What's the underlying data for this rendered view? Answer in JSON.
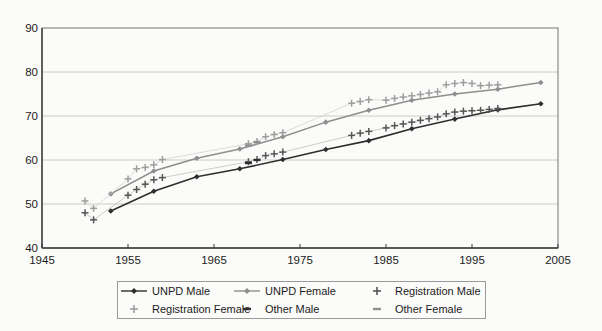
{
  "page": {
    "background": "#fbfbf9"
  },
  "chart_data": {
    "type": "line",
    "title": "",
    "xlabel": "",
    "ylabel": "",
    "xlim": [
      1945,
      2005
    ],
    "ylim": [
      40,
      90
    ],
    "xticks": [
      1945,
      1955,
      1965,
      1975,
      1985,
      1995,
      2005
    ],
    "yticks": [
      40,
      50,
      60,
      70,
      80,
      90
    ],
    "grid": "horizontal",
    "grid_color": "#cccccc",
    "axis_color": "#3a3a3a",
    "frame_color": "#757575",
    "tick_label_color": "#1b1b1b",
    "legend_position": "bottom-center",
    "series": [
      {
        "name": "UNPD Male",
        "marker": "diamond",
        "color": "#2e2e2e",
        "line_color": "#2e2e2e",
        "line_width": 1.6,
        "points": [
          [
            1953,
            48.4
          ],
          [
            1958,
            52.9
          ],
          [
            1963,
            56.2
          ],
          [
            1968,
            58.0
          ],
          [
            1973,
            60.1
          ],
          [
            1978,
            62.4
          ],
          [
            1983,
            64.4
          ],
          [
            1988,
            67.1
          ],
          [
            1993,
            69.3
          ],
          [
            1998,
            71.4
          ],
          [
            2003,
            72.8
          ]
        ]
      },
      {
        "name": "UNPD Female",
        "marker": "diamond",
        "color": "#8e8e8e",
        "line_color": "#8e8e8e",
        "line_width": 1.5,
        "points": [
          [
            1953,
            52.3
          ],
          [
            1958,
            57.5
          ],
          [
            1963,
            60.4
          ],
          [
            1968,
            62.5
          ],
          [
            1973,
            65.3
          ],
          [
            1978,
            68.6
          ],
          [
            1983,
            71.3
          ],
          [
            1988,
            73.6
          ],
          [
            1993,
            75.0
          ],
          [
            1998,
            76.1
          ],
          [
            2003,
            77.6
          ]
        ]
      },
      {
        "name": "Registration Male",
        "marker": "plus",
        "color": "#565656",
        "line_color": "#bdbdbd",
        "line_width": 0.75,
        "points": [
          [
            1950,
            48.0
          ],
          [
            1951,
            46.4
          ],
          [
            1955,
            52.0
          ],
          [
            1956,
            53.3
          ],
          [
            1957,
            54.5
          ],
          [
            1958,
            55.5
          ],
          [
            1959,
            56.0
          ],
          [
            1969,
            59.6
          ],
          [
            1970,
            60.1
          ],
          [
            1971,
            61.0
          ],
          [
            1972,
            61.4
          ],
          [
            1973,
            61.8
          ],
          [
            1981,
            65.6
          ],
          [
            1982,
            66.1
          ],
          [
            1983,
            66.5
          ],
          [
            1985,
            67.3
          ],
          [
            1986,
            67.8
          ],
          [
            1987,
            68.2
          ],
          [
            1988,
            68.6
          ],
          [
            1989,
            69.0
          ],
          [
            1990,
            69.4
          ],
          [
            1991,
            69.8
          ],
          [
            1992,
            70.5
          ],
          [
            1993,
            70.9
          ],
          [
            1994,
            71.1
          ],
          [
            1995,
            71.2
          ],
          [
            1996,
            71.3
          ],
          [
            1997,
            71.5
          ],
          [
            1998,
            71.7
          ]
        ]
      },
      {
        "name": "Registration Female",
        "marker": "plus",
        "color": "#9e9e9e",
        "line_color": "#d0d0d0",
        "line_width": 0.75,
        "points": [
          [
            1950,
            50.7
          ],
          [
            1951,
            49.0
          ],
          [
            1955,
            55.7
          ],
          [
            1956,
            58.0
          ],
          [
            1957,
            58.3
          ],
          [
            1958,
            58.9
          ],
          [
            1959,
            60.1
          ],
          [
            1969,
            63.7
          ],
          [
            1970,
            64.2
          ],
          [
            1971,
            65.3
          ],
          [
            1972,
            65.8
          ],
          [
            1973,
            66.2
          ],
          [
            1981,
            72.9
          ],
          [
            1982,
            73.3
          ],
          [
            1983,
            73.7
          ],
          [
            1985,
            73.6
          ],
          [
            1986,
            74.0
          ],
          [
            1987,
            74.3
          ],
          [
            1988,
            74.6
          ],
          [
            1989,
            74.9
          ],
          [
            1990,
            75.2
          ],
          [
            1991,
            75.5
          ],
          [
            1992,
            77.1
          ],
          [
            1993,
            77.4
          ],
          [
            1994,
            77.6
          ],
          [
            1995,
            77.4
          ],
          [
            1996,
            76.9
          ],
          [
            1997,
            77.0
          ],
          [
            1998,
            77.1
          ]
        ]
      },
      {
        "name": "Other Male",
        "marker": "dash",
        "color": "#2e2e2e",
        "line_color": "none",
        "line_width": 0,
        "points": [
          [
            1969,
            59.3
          ],
          [
            1970,
            60.0
          ]
        ]
      },
      {
        "name": "Other Female",
        "marker": "dash",
        "color": "#8e8e8e",
        "line_color": "none",
        "line_width": 0,
        "points": [
          [
            1969,
            63.3
          ],
          [
            1970,
            64.0
          ]
        ]
      }
    ]
  }
}
